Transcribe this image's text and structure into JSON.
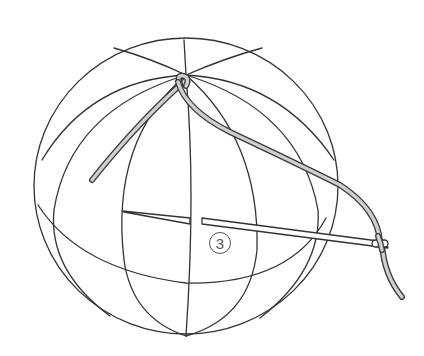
{
  "figure": {
    "step_label": "3",
    "colors": {
      "line": "#333333",
      "thread_fill": "#cfcfcf",
      "thread_outline": "#3a3a3a",
      "background": "#ffffff",
      "label": "#555555"
    }
  }
}
